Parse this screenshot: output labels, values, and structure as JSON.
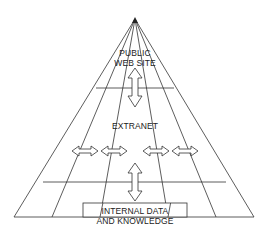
{
  "diagram": {
    "type": "pyramid-layers",
    "layers": [
      {
        "id": "public",
        "line1": "PUBLIC",
        "line2": "WEB SITE"
      },
      {
        "id": "extranet",
        "label": "EXTRANET"
      },
      {
        "id": "internal",
        "line1": "INTERNAL DATA",
        "line2": "AND KNOWLEDGE"
      }
    ],
    "arrows": [
      {
        "from": "public",
        "to": "extranet",
        "direction": "vertical-bidirectional"
      },
      {
        "from": "extranet",
        "to": "internal",
        "direction": "vertical-bidirectional"
      },
      {
        "within": "extranet",
        "direction": "horizontal-bidirectional",
        "count": 4
      }
    ],
    "colors": {
      "line": "#333333",
      "background": "#ffffff"
    }
  }
}
